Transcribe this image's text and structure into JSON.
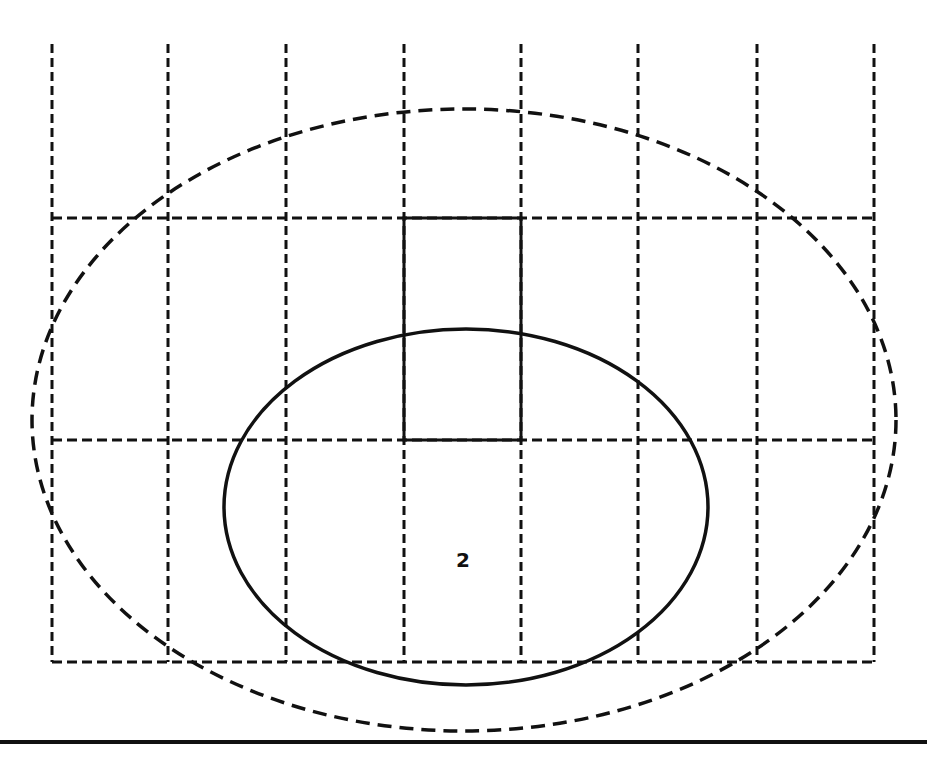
{
  "diagram": {
    "colors": {
      "ink": "#111111",
      "paper": "#ffffff"
    },
    "grid": {
      "vertical_lines_x": [
        52,
        168,
        286,
        404,
        521,
        638,
        757,
        874
      ],
      "horizontal_lines_y": [
        218,
        440,
        662
      ],
      "top_y": 44,
      "bottom_y": 662,
      "style": "dashed"
    },
    "highlight_cell": {
      "x": 404,
      "y": 218,
      "width": 117,
      "height": 222,
      "style": "solid"
    },
    "outer_ellipse": {
      "cx": 464,
      "cy": 420,
      "rx": 432,
      "ry": 311,
      "style": "dashed"
    },
    "inner_ellipse": {
      "cx": 466,
      "cy": 507,
      "rx": 242,
      "ry": 178,
      "style": "solid"
    },
    "label": {
      "text": "2",
      "x": 463,
      "y": 560
    },
    "baseline": {
      "y": 742,
      "x1": 0,
      "x2": 927,
      "style": "solid"
    }
  }
}
